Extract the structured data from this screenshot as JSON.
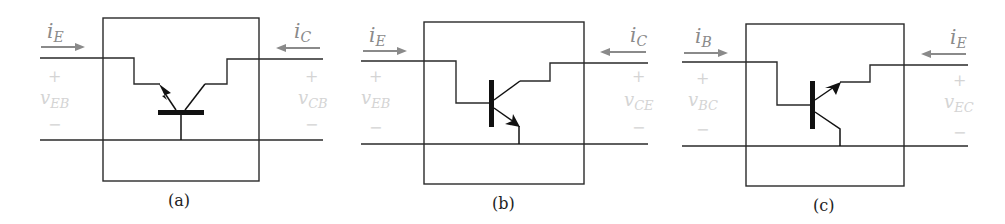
{
  "figure": {
    "panels": [
      {
        "id": "a",
        "caption": "(a)",
        "configuration": "common-base",
        "left_current": {
          "symbol": "i",
          "subscript": "E",
          "direction": "in"
        },
        "right_current": {
          "symbol": "i",
          "subscript": "C",
          "direction": "in"
        },
        "left_voltage": {
          "symbol": "v",
          "subscript": "EB",
          "plus": "+",
          "minus": "−"
        },
        "right_voltage": {
          "symbol": "v",
          "subscript": "CB",
          "plus": "+",
          "minus": "−"
        }
      },
      {
        "id": "b",
        "caption": "(b)",
        "configuration": "common-emitter",
        "left_current": {
          "symbol": "i",
          "subscript": "E",
          "direction": "in"
        },
        "right_current": {
          "symbol": "i",
          "subscript": "C",
          "direction": "in"
        },
        "left_voltage": {
          "symbol": "v",
          "subscript": "EB",
          "plus": "+",
          "minus": "−"
        },
        "right_voltage": {
          "symbol": "v",
          "subscript": "CE",
          "plus": "+",
          "minus": "−"
        }
      },
      {
        "id": "c",
        "caption": "(c)",
        "configuration": "common-collector",
        "left_current": {
          "symbol": "i",
          "subscript": "B",
          "direction": "in"
        },
        "right_current": {
          "symbol": "i",
          "subscript": "E",
          "direction": "in"
        },
        "left_voltage": {
          "symbol": "v",
          "subscript": "BC",
          "plus": "+",
          "minus": "−"
        },
        "right_voltage": {
          "symbol": "v",
          "subscript": "EC",
          "plus": "+",
          "minus": "−"
        }
      }
    ],
    "colors": {
      "wire": "#2a2a2a",
      "current_arrow": "#8a8a8a",
      "voltage_label": "#d4d4d4",
      "device": "#111111"
    }
  }
}
